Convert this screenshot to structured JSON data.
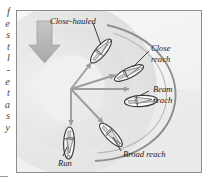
{
  "page": {
    "margin_text_lines": [
      "f",
      "e",
      "s",
      "t",
      "l",
      "-",
      "e",
      "t",
      "a",
      "s",
      "y"
    ],
    "background_color": "#ffffff"
  },
  "figure": {
    "frame": {
      "border_color": "#8e8e8e",
      "background_color": "#f4f4f4"
    },
    "colors": {
      "wind_arrow": "#b4b4b4",
      "course_arrow": "#9a9a9a",
      "arc": "#8c8c8c",
      "shading_outer": "#e3e3e3",
      "shading_mid": "#d9d9d9",
      "shading_inner": "#ededed",
      "label_text": "#1c1c1c",
      "leader_line": "#2a2a2a",
      "hull": "#ffffff",
      "hull_outline": "#3c3c3c",
      "sail": "#c9c9c9"
    },
    "wind": {
      "name": "wind-direction-arrow",
      "direction": "down"
    },
    "hub": {
      "x": 54,
      "y": 78
    },
    "labels": [
      {
        "id": "close-hauled",
        "text": "Close-hauled",
        "lines": [
          "Close-hauled"
        ],
        "x": 44,
        "y": 16
      },
      {
        "id": "close-reach",
        "text": "Close reach",
        "lines": [
          "Close",
          "reach"
        ],
        "x": 136,
        "y": 40
      },
      {
        "id": "beam-reach",
        "text": "Beam reach",
        "lines": [
          "Beam",
          "reach"
        ],
        "x": 136,
        "y": 84
      },
      {
        "id": "broad-reach",
        "text": "Broad reach",
        "lines": [
          "Broad reach"
        ],
        "x": 106,
        "y": 147
      },
      {
        "id": "run",
        "text": "Run",
        "lines": [
          "Run"
        ],
        "x": 42,
        "y": 156
      }
    ],
    "points_of_sail": [
      {
        "id": "close-hauled",
        "label": "Close-hauled",
        "boat_x": 82,
        "boat_y": 40,
        "angle_deg": -52
      },
      {
        "id": "close-reach",
        "label": "Close reach",
        "boat_x": 110,
        "boat_y": 62,
        "angle_deg": -28
      },
      {
        "id": "beam-reach",
        "label": "Beam reach",
        "boat_x": 122,
        "boat_y": 90,
        "angle_deg": 0
      },
      {
        "id": "broad-reach",
        "label": "Broad reach",
        "boat_x": 92,
        "boat_y": 126,
        "angle_deg": 44
      },
      {
        "id": "run",
        "label": "Run",
        "boat_x": 52,
        "boat_y": 133,
        "angle_deg": 90
      }
    ]
  }
}
